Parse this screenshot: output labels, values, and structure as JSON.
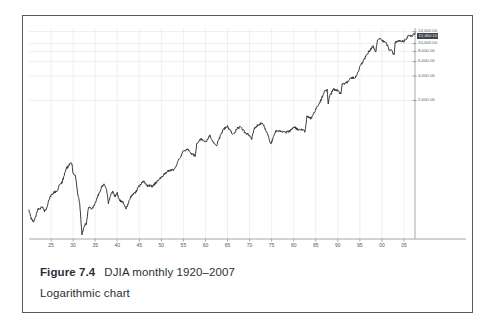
{
  "figure": {
    "caption_number": "Figure 7.4",
    "caption_title": "DJIA monthly 1920–2007",
    "caption_subtitle": "Logarithmic chart"
  },
  "chart_data": {
    "type": "line",
    "title": "DJIA monthly 1920–2007",
    "subtitle": "Logarithmic chart",
    "xlabel": "",
    "ylabel": "",
    "scale": "logarithmic",
    "grid": true,
    "legend": null,
    "series_name": "DJIA",
    "line_color": "#2e3236",
    "grid_color": "#e9ecef",
    "axis_color": "#7c8185",
    "xtick_labels": [
      "25",
      "30",
      "35",
      "40",
      "45",
      "50",
      "55",
      "60",
      "65",
      "70",
      "75",
      "80",
      "85",
      "90",
      "95",
      "00",
      "05"
    ],
    "xtick_years": [
      1925,
      1930,
      1935,
      1940,
      1945,
      1950,
      1955,
      1960,
      1965,
      1970,
      1975,
      1980,
      1985,
      1990,
      1995,
      2000,
      2005
    ],
    "ytick_labels": [
      "14,000.00",
      "10,000.00",
      "8,000.00",
      "6,000.00",
      "4,000.00",
      "2,000.00"
    ],
    "ytick_values": [
      14000,
      10000,
      8000,
      6000,
      4000,
      2000
    ],
    "ylim": [
      40,
      15500
    ],
    "xlim": [
      1920,
      2007.5
    ],
    "price_marker": {
      "label": "12,460.10",
      "value": 12460.1,
      "background": "#3f4347",
      "text_color": "#e8eaec"
    },
    "x": [
      1920.0,
      1920.5,
      1921.0,
      1921.5,
      1922.0,
      1922.5,
      1923.0,
      1923.5,
      1924.0,
      1924.5,
      1925.0,
      1925.5,
      1926.0,
      1926.5,
      1927.0,
      1927.5,
      1928.0,
      1928.5,
      1929.0,
      1929.3,
      1929.7,
      1930.0,
      1930.5,
      1931.0,
      1931.5,
      1932.0,
      1932.5,
      1933.0,
      1933.5,
      1934.0,
      1934.5,
      1935.0,
      1935.5,
      1936.0,
      1936.5,
      1937.0,
      1937.5,
      1938.0,
      1938.5,
      1939.0,
      1939.5,
      1940.0,
      1940.5,
      1941.0,
      1941.5,
      1942.0,
      1942.5,
      1943.0,
      1943.5,
      1944.0,
      1945.0,
      1946.0,
      1946.5,
      1947.0,
      1948.0,
      1949.0,
      1950.0,
      1951.0,
      1952.0,
      1953.0,
      1954.0,
      1955.0,
      1956.0,
      1957.0,
      1957.7,
      1958.0,
      1959.0,
      1960.0,
      1961.0,
      1962.0,
      1962.5,
      1963.0,
      1964.0,
      1965.0,
      1966.0,
      1966.7,
      1967.0,
      1968.0,
      1969.0,
      1970.0,
      1970.5,
      1971.0,
      1972.0,
      1973.0,
      1974.0,
      1974.8,
      1975.0,
      1976.0,
      1977.0,
      1978.0,
      1979.0,
      1980.0,
      1981.0,
      1982.0,
      1982.6,
      1983.0,
      1984.0,
      1985.0,
      1986.0,
      1987.0,
      1987.6,
      1987.8,
      1988.0,
      1989.0,
      1990.0,
      1990.7,
      1991.0,
      1992.0,
      1993.0,
      1994.0,
      1995.0,
      1996.0,
      1997.0,
      1998.0,
      1998.6,
      1999.0,
      1999.8,
      2000.0,
      2001.0,
      2001.7,
      2002.0,
      2002.8,
      2003.0,
      2004.0,
      2005.0,
      2006.0,
      2007.0,
      2007.5
    ],
    "y": [
      89,
      72,
      65,
      75,
      92,
      95,
      98,
      88,
      95,
      120,
      138,
      147,
      150,
      160,
      190,
      198,
      245,
      295,
      318,
      330,
      343,
      250,
      240,
      150,
      110,
      45,
      58,
      62,
      100,
      95,
      98,
      110,
      130,
      150,
      175,
      190,
      170,
      110,
      140,
      150,
      135,
      145,
      120,
      115,
      110,
      95,
      110,
      130,
      140,
      145,
      180,
      205,
      185,
      180,
      178,
      200,
      230,
      260,
      280,
      285,
      380,
      485,
      500,
      440,
      420,
      580,
      680,
      615,
      735,
      580,
      560,
      655,
      875,
      970,
      790,
      790,
      905,
      945,
      800,
      755,
      680,
      890,
      1020,
      1050,
      800,
      590,
      620,
      850,
      830,
      810,
      840,
      950,
      880,
      880,
      830,
      1260,
      1210,
      1550,
      1900,
      2650,
      2720,
      1740,
      2170,
      2750,
      2630,
      2400,
      3170,
      3300,
      3750,
      3830,
      5100,
      6450,
      7900,
      9180,
      7840,
      11000,
      11500,
      10900,
      10000,
      8200,
      8340,
      7290,
      10450,
      10780,
      10700,
      12400,
      12600,
      13400
    ]
  }
}
